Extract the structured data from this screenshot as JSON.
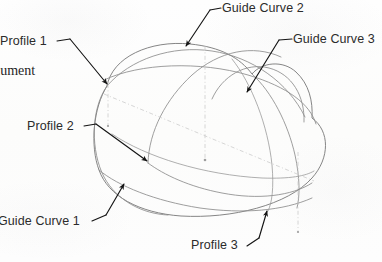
{
  "figure": {
    "kind": "cad-loft-diagram",
    "background_color": "#fdfdfc",
    "line_color": "#8a8a8a",
    "leader_color": "#1a1a1a",
    "text_color": "#2b2b2b",
    "centerline_color": "#c9c9c9"
  },
  "labels": {
    "profile_1": "Profile 1",
    "profile_2": "Profile 2",
    "profile_3": "Profile 3",
    "guide_curve_1": "Guide Curve 1",
    "guide_curve_2": "Guide Curve 2",
    "guide_curve_3": "Guide Curve 3",
    "clipped_word": "cument"
  },
  "annotations": [
    {
      "name": "profile-1",
      "text": "Profile 1",
      "anchor_x": 0,
      "anchor_y": 35,
      "tip_x": 108,
      "tip_y": 86
    },
    {
      "name": "profile-2",
      "text": "Profile 2",
      "anchor_x": 27,
      "anchor_y": 120,
      "tip_x": 148,
      "tip_y": 163
    },
    {
      "name": "profile-3",
      "text": "Profile 3",
      "anchor_x": 191,
      "anchor_y": 239,
      "tip_x": 266,
      "tip_y": 210
    },
    {
      "name": "guide-curve-1",
      "text": "Guide Curve 1",
      "anchor_x": -2,
      "anchor_y": 215,
      "tip_x": 123,
      "tip_y": 184
    },
    {
      "name": "guide-curve-2",
      "text": "Guide Curve 2",
      "anchor_x": 222,
      "anchor_y": 2,
      "tip_x": 186,
      "tip_y": 46
    },
    {
      "name": "guide-curve-3",
      "text": "Guide Curve 3",
      "anchor_x": 293,
      "anchor_y": 33,
      "tip_x": 247,
      "tip_y": 92
    }
  ]
}
